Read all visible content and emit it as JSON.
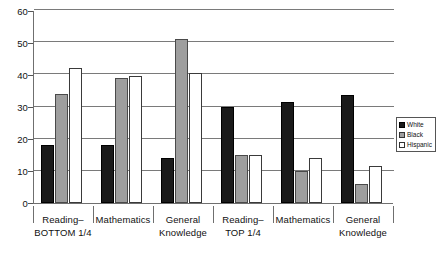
{
  "chart_data": {
    "type": "bar",
    "title": "",
    "subtitle": "",
    "xlabel": "",
    "ylabel": "",
    "ylim": [
      0,
      60
    ],
    "yticks": [
      0,
      10,
      20,
      30,
      40,
      50,
      60
    ],
    "ytick_labels": [
      "0",
      "10",
      "20",
      "30",
      "40",
      "50",
      "60"
    ],
    "grid": true,
    "grid_axis": "y",
    "legend_position": "right",
    "categories": [
      "Reading– BOTTOM 1/4",
      "Mathematics",
      "General Knowledge",
      "Reading– TOP 1/4",
      "Mathematics",
      "General Knowledge"
    ],
    "category_lines": [
      [
        "Reading–",
        "BOTTOM 1/4"
      ],
      [
        "Mathematics",
        ""
      ],
      [
        "General",
        "Knowledge"
      ],
      [
        "Reading–",
        "TOP 1/4"
      ],
      [
        "Mathematics",
        ""
      ],
      [
        "General",
        "Knowledge"
      ]
    ],
    "series": [
      {
        "name": "White",
        "color": "#1a1a1a",
        "values": [
          18,
          18,
          14,
          30,
          31.5,
          33.5
        ]
      },
      {
        "name": "Black",
        "color": "#9e9e9e",
        "values": [
          34,
          39,
          51,
          15,
          10,
          6
        ]
      },
      {
        "name": "Hispanic",
        "color": "#ffffff",
        "values": [
          42,
          39.5,
          40.5,
          15,
          14,
          11.5
        ]
      }
    ]
  },
  "legend": {
    "items": [
      {
        "label": "White",
        "swatch": "legend-swatch-white"
      },
      {
        "label": "Black",
        "swatch": "legend-swatch-black"
      },
      {
        "label": "Hispanic",
        "swatch": "legend-swatch-hispanic"
      }
    ]
  },
  "axis": {
    "y_labels": [
      "60",
      "50",
      "40",
      "30",
      "20",
      "10",
      "0"
    ]
  }
}
